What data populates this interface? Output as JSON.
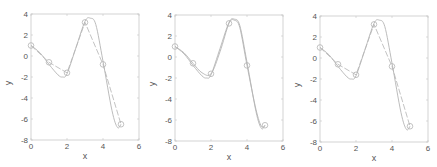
{
  "chart_data": [
    {
      "type": "line",
      "title": "",
      "xlabel": "x",
      "ylabel": "y",
      "xlim": [
        0,
        6
      ],
      "ylim": [
        -8,
        4
      ],
      "xticks": [
        0,
        2,
        4,
        6
      ],
      "yticks": [
        4,
        2,
        0,
        -2,
        -4,
        -6,
        -8
      ],
      "grid": false,
      "series": [
        {
          "name": "data points",
          "style": "markers-circle",
          "x": [
            0,
            1,
            2,
            3,
            4,
            5
          ],
          "y": [
            1,
            -0.6,
            -1.6,
            3.2,
            -0.8,
            -6.5
          ]
        },
        {
          "name": "linear",
          "style": "line",
          "x": [
            0,
            1,
            2,
            3,
            4,
            5
          ],
          "y": [
            1,
            -0.6,
            -1.6,
            3.2,
            -0.8,
            -6.5
          ]
        },
        {
          "name": "spline",
          "style": "line",
          "x": [
            0,
            0.5,
            1,
            1.5,
            1.75,
            2,
            2.5,
            3,
            3.3,
            3.6,
            4,
            4.5,
            4.8,
            5
          ],
          "y": [
            1,
            0.3,
            -0.8,
            -1.8,
            -2.0,
            -1.7,
            0.8,
            3.3,
            3.6,
            3.0,
            -0.5,
            -5.2,
            -6.8,
            -6.5
          ]
        }
      ]
    },
    {
      "type": "line",
      "title": "",
      "xlabel": "x",
      "ylabel": "y",
      "xlim": [
        0,
        6
      ],
      "ylim": [
        -8,
        4
      ],
      "xticks": [
        0,
        2,
        4,
        6
      ],
      "yticks": [
        4,
        2,
        0,
        -2,
        -4,
        -6,
        -8
      ],
      "grid": false,
      "series": [
        {
          "name": "data points",
          "style": "markers-circle",
          "x": [
            0,
            1,
            2,
            3,
            4,
            5
          ],
          "y": [
            1,
            -0.6,
            -1.6,
            3.2,
            -0.8,
            -6.5
          ]
        },
        {
          "name": "spline",
          "style": "line",
          "x": [
            0,
            0.5,
            1,
            1.5,
            1.75,
            2,
            2.5,
            3,
            3.3,
            3.6,
            4,
            4.5,
            4.8,
            5
          ],
          "y": [
            1,
            0.3,
            -0.8,
            -1.8,
            -2.0,
            -1.7,
            0.8,
            3.3,
            3.6,
            3.0,
            -0.5,
            -5.2,
            -6.8,
            -6.5
          ]
        },
        {
          "name": "pchip",
          "style": "line",
          "x": [
            0,
            0.5,
            1,
            1.5,
            2,
            2.5,
            3,
            3.3,
            3.6,
            4,
            4.5,
            4.8,
            5
          ],
          "y": [
            1,
            0.4,
            -0.6,
            -1.5,
            -1.6,
            0.5,
            3.2,
            3.5,
            2.8,
            -0.8,
            -5.0,
            -6.6,
            -6.5
          ]
        }
      ]
    },
    {
      "type": "line",
      "title": "",
      "xlabel": "x",
      "ylabel": "y",
      "xlim": [
        0,
        6
      ],
      "ylim": [
        -8,
        4
      ],
      "xticks": [
        0,
        2,
        4,
        6
      ],
      "yticks": [
        4,
        2,
        0,
        -2,
        -4,
        -6,
        -8
      ],
      "grid": false,
      "series": [
        {
          "name": "data points",
          "style": "markers-circle",
          "x": [
            0,
            1,
            2,
            3,
            4,
            5
          ],
          "y": [
            1,
            -0.6,
            -1.6,
            3.2,
            -0.8,
            -6.5
          ]
        },
        {
          "name": "linear",
          "style": "line",
          "x": [
            0,
            1,
            2,
            3,
            4,
            5
          ],
          "y": [
            1,
            -0.6,
            -1.6,
            3.2,
            -0.8,
            -6.5
          ]
        },
        {
          "name": "spline",
          "style": "line",
          "x": [
            0,
            0.5,
            1,
            1.5,
            1.75,
            2,
            2.5,
            3,
            3.3,
            3.6,
            4,
            4.5,
            4.8,
            5
          ],
          "y": [
            1,
            0.3,
            -0.8,
            -1.8,
            -2.0,
            -1.7,
            0.8,
            3.3,
            3.6,
            3.0,
            -0.5,
            -5.2,
            -6.8,
            -6.5
          ]
        }
      ]
    }
  ],
  "colors": {
    "axis": "#c8c8c8",
    "line": "#b4b4b4",
    "tick_text": "#555555"
  },
  "panels": [
    {
      "left": 31,
      "top": 14,
      "right": 139,
      "bottom": 140
    },
    {
      "left": 175,
      "top": 15,
      "right": 283,
      "bottom": 141
    },
    {
      "left": 320,
      "top": 16,
      "right": 428,
      "bottom": 142
    }
  ]
}
